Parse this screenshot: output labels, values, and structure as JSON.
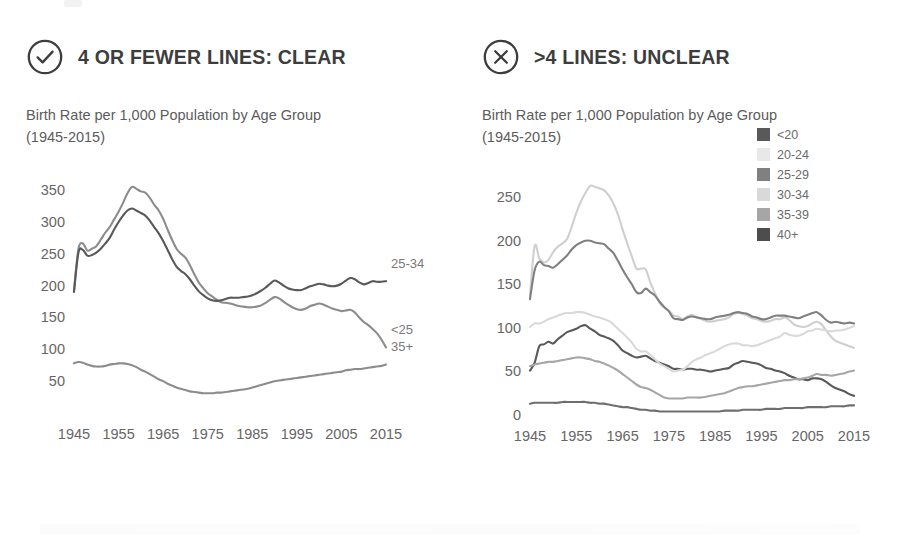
{
  "panels": [
    {
      "badge_icon": "check-circle-icon",
      "heading": "4 OR FEWER LINES: CLEAR",
      "chart_title": "Birth Rate per 1,000 Population by Age Group (1945-2015)"
    },
    {
      "badge_icon": "x-circle-icon",
      "heading": ">4 LINES: UNCLEAR",
      "chart_title": "Birth Rate per 1,000 Population by Age Group (1945-2015)"
    }
  ],
  "colors": {
    "ink": "#3d3d3d",
    "muted": "#666666",
    "series_dark": "#595959",
    "series_mid": "#808080",
    "series_light": "#a6a6a6",
    "legend_20_24": "#e8e8e8",
    "legend_30_34": "#d9d9d9",
    "legend_40_plus": "#4d4d4d"
  },
  "legend": {
    "items": [
      {
        "label": "<20",
        "color": "#595959"
      },
      {
        "label": "20-24",
        "color": "#e8e8e8"
      },
      {
        "label": "25-29",
        "color": "#808080"
      },
      {
        "label": "30-34",
        "color": "#d9d9d9"
      },
      {
        "label": "35-39",
        "color": "#a6a6a6"
      },
      {
        "label": "40+",
        "color": "#4d4d4d"
      }
    ]
  },
  "chart_data": [
    {
      "id": "clear",
      "type": "line",
      "title": "Birth Rate per 1,000 Population by Age Group (1945-2015)",
      "xlabel": "",
      "ylabel": "",
      "xlim": [
        1945,
        2015
      ],
      "ylim": [
        0,
        380
      ],
      "yticks": [
        50,
        100,
        150,
        200,
        250,
        300,
        350
      ],
      "xticks": [
        1945,
        1955,
        1965,
        1975,
        1985,
        1995,
        2005,
        2015
      ],
      "grid": false,
      "legend_position": "inline-right",
      "x": [
        1945,
        1946,
        1947,
        1948,
        1949,
        1950,
        1951,
        1952,
        1953,
        1954,
        1955,
        1956,
        1957,
        1958,
        1959,
        1960,
        1961,
        1962,
        1963,
        1964,
        1965,
        1966,
        1967,
        1968,
        1969,
        1970,
        1971,
        1972,
        1973,
        1974,
        1975,
        1976,
        1977,
        1978,
        1979,
        1980,
        1981,
        1982,
        1983,
        1984,
        1985,
        1986,
        1987,
        1988,
        1989,
        1990,
        1991,
        1992,
        1993,
        1994,
        1995,
        1996,
        1997,
        1998,
        1999,
        2000,
        2001,
        2002,
        2003,
        2004,
        2005,
        2006,
        2007,
        2008,
        2009,
        2010,
        2011,
        2012,
        2013,
        2014,
        2015
      ],
      "series": [
        {
          "name": "<25",
          "color": "#8c8c8c",
          "values": [
            193,
            258,
            266,
            255,
            258,
            262,
            272,
            283,
            292,
            304,
            316,
            330,
            345,
            355,
            352,
            348,
            346,
            338,
            327,
            318,
            305,
            288,
            272,
            258,
            250,
            244,
            232,
            218,
            205,
            196,
            188,
            183,
            178,
            174,
            173,
            172,
            170,
            168,
            167,
            166,
            166,
            167,
            169,
            173,
            178,
            182,
            180,
            175,
            170,
            166,
            163,
            162,
            164,
            168,
            170,
            172,
            170,
            167,
            164,
            162,
            160,
            161,
            162,
            158,
            150,
            143,
            138,
            132,
            125,
            115,
            103
          ]
        },
        {
          "name": "25-34",
          "color": "#595959",
          "values": [
            190,
            252,
            256,
            247,
            248,
            252,
            258,
            266,
            275,
            288,
            300,
            310,
            318,
            321,
            318,
            314,
            310,
            302,
            292,
            282,
            270,
            256,
            242,
            230,
            223,
            218,
            210,
            200,
            191,
            185,
            180,
            177,
            176,
            177,
            179,
            181,
            181,
            181,
            182,
            183,
            185,
            188,
            192,
            197,
            203,
            208,
            205,
            200,
            196,
            194,
            193,
            193,
            196,
            199,
            201,
            203,
            202,
            200,
            199,
            200,
            203,
            208,
            212,
            210,
            205,
            202,
            204,
            207,
            206,
            206,
            207
          ]
        },
        {
          "name": "35+",
          "color": "#8c8c8c",
          "values": [
            78,
            80,
            79,
            76,
            74,
            73,
            73,
            74,
            76,
            77,
            78,
            78,
            77,
            75,
            72,
            68,
            65,
            61,
            57,
            53,
            50,
            46,
            43,
            40,
            38,
            36,
            34,
            33,
            32,
            31,
            31,
            31,
            32,
            32,
            33,
            34,
            35,
            36,
            37,
            38,
            40,
            42,
            44,
            46,
            48,
            50,
            51,
            52,
            53,
            54,
            55,
            56,
            57,
            58,
            59,
            60,
            61,
            62,
            63,
            64,
            65,
            67,
            68,
            69,
            69,
            70,
            71,
            72,
            73,
            74,
            76
          ]
        }
      ],
      "inline_labels": [
        {
          "text": "25-34",
          "series": "25-34"
        },
        {
          "text": "<25",
          "series": "<25"
        },
        {
          "text": "35+",
          "series": "35+"
        }
      ]
    },
    {
      "id": "unclear",
      "type": "line",
      "title": "Birth Rate per 1,000 Population by Age Group (1945-2015)",
      "xlabel": "",
      "ylabel": "",
      "xlim": [
        1945,
        2015
      ],
      "ylim": [
        0,
        280
      ],
      "yticks": [
        0,
        50,
        100,
        150,
        200,
        250
      ],
      "xticks": [
        1945,
        1955,
        1965,
        1975,
        1985,
        1995,
        2005,
        2015
      ],
      "grid": false,
      "legend_position": "top-right",
      "x": [
        1945,
        1946,
        1947,
        1948,
        1949,
        1950,
        1951,
        1952,
        1953,
        1954,
        1955,
        1956,
        1957,
        1958,
        1959,
        1960,
        1961,
        1962,
        1963,
        1964,
        1965,
        1966,
        1967,
        1968,
        1969,
        1970,
        1971,
        1972,
        1973,
        1974,
        1975,
        1976,
        1977,
        1978,
        1979,
        1980,
        1981,
        1982,
        1983,
        1984,
        1985,
        1986,
        1987,
        1988,
        1989,
        1990,
        1991,
        1992,
        1993,
        1994,
        1995,
        1996,
        1997,
        1998,
        1999,
        2000,
        2001,
        2002,
        2003,
        2004,
        2005,
        2006,
        2007,
        2008,
        2009,
        2010,
        2011,
        2012,
        2013,
        2014,
        2015
      ],
      "series": [
        {
          "name": "<20",
          "color": "#595959",
          "values": [
            51,
            60,
            79,
            81,
            84,
            82,
            87,
            91,
            95,
            97,
            99,
            102,
            103,
            99,
            96,
            92,
            90,
            88,
            85,
            80,
            74,
            71,
            68,
            66,
            67,
            68,
            65,
            62,
            60,
            58,
            56,
            53,
            53,
            52,
            53,
            53,
            52,
            52,
            51,
            50,
            51,
            52,
            53,
            54,
            58,
            60,
            62,
            61,
            60,
            59,
            57,
            54,
            53,
            51,
            50,
            48,
            45,
            43,
            41,
            41,
            40,
            42,
            42,
            41,
            38,
            34,
            31,
            29,
            27,
            24,
            22
          ]
        },
        {
          "name": "20-24",
          "color": "#cfcfcf",
          "values": [
            137,
            194,
            180,
            175,
            178,
            187,
            193,
            197,
            202,
            216,
            232,
            245,
            255,
            263,
            262,
            260,
            258,
            252,
            243,
            230,
            213,
            197,
            182,
            168,
            168,
            167,
            152,
            140,
            129,
            123,
            120,
            114,
            113,
            110,
            113,
            115,
            112,
            110,
            108,
            107,
            108,
            109,
            110,
            112,
            116,
            117,
            116,
            114,
            111,
            110,
            108,
            107,
            108,
            110,
            110,
            112,
            109,
            104,
            102,
            101,
            102,
            105,
            107,
            104,
            97,
            90,
            85,
            83,
            81,
            79,
            77
          ]
        },
        {
          "name": "25-29",
          "color": "#808080",
          "values": [
            133,
            166,
            176,
            172,
            171,
            169,
            173,
            178,
            183,
            190,
            195,
            198,
            200,
            200,
            198,
            197,
            196,
            191,
            186,
            177,
            167,
            158,
            150,
            141,
            140,
            145,
            141,
            137,
            130,
            124,
            119,
            111,
            110,
            109,
            112,
            113,
            112,
            111,
            110,
            110,
            112,
            113,
            114,
            115,
            117,
            118,
            117,
            116,
            113,
            112,
            110,
            110,
            112,
            114,
            114,
            114,
            113,
            112,
            111,
            113,
            115,
            117,
            118,
            114,
            109,
            106,
            107,
            106,
            105,
            106,
            105
          ]
        },
        {
          "name": "30-34",
          "color": "#d9d9d9",
          "values": [
            101,
            105,
            105,
            107,
            110,
            112,
            114,
            116,
            117,
            117,
            118,
            118,
            117,
            115,
            113,
            112,
            110,
            108,
            104,
            99,
            94,
            89,
            83,
            76,
            73,
            73,
            69,
            64,
            59,
            56,
            53,
            50,
            51,
            52,
            56,
            61,
            64,
            66,
            69,
            71,
            73,
            76,
            79,
            81,
            82,
            82,
            80,
            80,
            79,
            80,
            82,
            84,
            86,
            88,
            90,
            94,
            92,
            91,
            91,
            93,
            96,
            97,
            99,
            98,
            97,
            96,
            97,
            97,
            98,
            100,
            102
          ]
        },
        {
          "name": "35-39",
          "color": "#a6a6a6",
          "values": [
            56,
            58,
            59,
            60,
            61,
            61,
            62,
            63,
            64,
            65,
            66,
            66,
            65,
            64,
            62,
            61,
            59,
            57,
            54,
            51,
            47,
            43,
            39,
            35,
            32,
            31,
            29,
            26,
            23,
            20,
            19,
            19,
            19,
            19,
            20,
            20,
            20,
            20,
            21,
            22,
            23,
            24,
            25,
            27,
            29,
            31,
            32,
            33,
            33,
            34,
            35,
            36,
            37,
            38,
            39,
            40,
            40,
            41,
            41,
            42,
            43,
            45,
            47,
            46,
            46,
            45,
            46,
            47,
            48,
            50,
            51
          ]
        },
        {
          "name": "40+",
          "color": "#6e6e6e",
          "values": [
            13,
            14,
            14,
            14,
            14,
            14,
            14,
            15,
            15,
            15,
            15,
            15,
            15,
            14,
            14,
            13,
            13,
            12,
            11,
            10,
            9,
            9,
            8,
            7,
            6,
            6,
            5,
            5,
            4,
            4,
            4,
            4,
            4,
            4,
            4,
            4,
            4,
            4,
            4,
            4,
            4,
            4,
            5,
            5,
            5,
            5,
            6,
            6,
            6,
            6,
            6,
            7,
            7,
            7,
            7,
            8,
            8,
            8,
            8,
            8,
            9,
            9,
            9,
            9,
            9,
            10,
            10,
            10,
            10,
            11,
            11
          ]
        }
      ]
    }
  ]
}
